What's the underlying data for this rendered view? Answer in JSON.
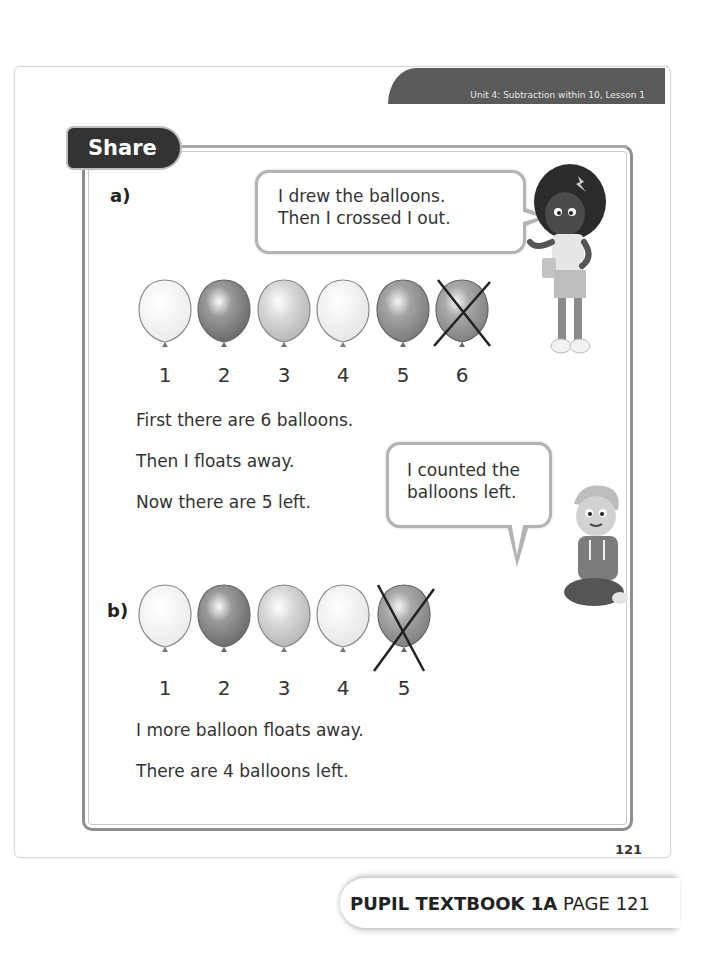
{
  "header": {
    "unit_label": "Unit 4: Subtraction within 10, Lesson 1"
  },
  "section": {
    "tab_label": "Share"
  },
  "part_a": {
    "label": "a)",
    "speech_bubble_girl": {
      "line1": "I drew the balloons.",
      "line2": "Then I crossed I out."
    },
    "balloons": [
      {
        "number": "1",
        "shade": "#f4f4f4",
        "crossed": false
      },
      {
        "number": "2",
        "shade": "#7a7a7a",
        "crossed": false
      },
      {
        "number": "3",
        "shade": "#c8c8c8",
        "crossed": false
      },
      {
        "number": "4",
        "shade": "#f0f0f0",
        "crossed": false
      },
      {
        "number": "5",
        "shade": "#8c8c8c",
        "crossed": false
      },
      {
        "number": "6",
        "shade": "#959595",
        "crossed": true
      }
    ],
    "lines": [
      "First there are 6 balloons.",
      "Then I floats away.",
      "Now there are 5 left."
    ],
    "speech_bubble_boy": {
      "line1": "I counted the",
      "line2": "balloons left."
    }
  },
  "part_b": {
    "label": "b)",
    "balloons": [
      {
        "number": "1",
        "shade": "#f4f4f4",
        "crossed": false
      },
      {
        "number": "2",
        "shade": "#7a7a7a",
        "crossed": false
      },
      {
        "number": "3",
        "shade": "#c8c8c8",
        "crossed": false
      },
      {
        "number": "4",
        "shade": "#f0f0f0",
        "crossed": false
      },
      {
        "number": "5",
        "shade": "#959595",
        "crossed": true
      }
    ],
    "lines": [
      "I more balloon floats away.",
      "There are 4 balloons left."
    ]
  },
  "page_number": "121",
  "footer": {
    "book_label": "PUPIL TEXTBOOK 1A",
    "page_label": "PAGE 121"
  },
  "colors": {
    "banner": "#5a5a5a",
    "share_tab": "#333333",
    "frame": "#8e8e8e",
    "bubble_border": "#b3b3b3"
  }
}
